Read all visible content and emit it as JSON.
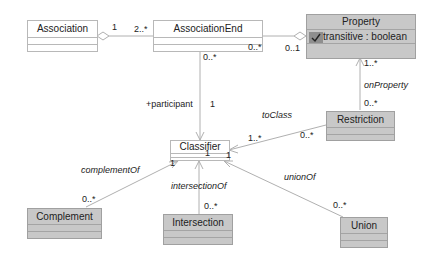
{
  "diagram": {
    "type": "UML class diagram",
    "classes": {
      "association": {
        "name": "Association",
        "style": "white"
      },
      "association_end": {
        "name": "AssociationEnd",
        "style": "white"
      },
      "property": {
        "name": "Property",
        "style": "grey",
        "attribute": "transitive : boolean",
        "attribute_icon": "attribute-icon"
      },
      "classifier": {
        "name": "Classifier",
        "style": "white"
      },
      "restriction": {
        "name": "Restriction",
        "style": "grey"
      },
      "complement": {
        "name": "Complement",
        "style": "grey"
      },
      "intersection": {
        "name": "Intersection",
        "style": "grey"
      },
      "union": {
        "name": "Union",
        "style": "grey"
      }
    },
    "relations": {
      "association_to_end": {
        "kind": "aggregation",
        "source_mult": "1",
        "target_mult": "2..*"
      },
      "end_to_property": {
        "kind": "aggregation",
        "source_mult": "0..*",
        "target_mult": "0..1"
      },
      "end_to_classifier": {
        "kind": "directed-association",
        "source_mult": "0..*",
        "role": "+participant",
        "target_mult": "1"
      },
      "restriction_to_property": {
        "kind": "directed-association",
        "name": "onProperty",
        "source_mult": "0..*",
        "target_mult": "1..*"
      },
      "restriction_to_classifier": {
        "kind": "directed-association",
        "name": "toClass",
        "source_mult": "0..*",
        "target_mult": "1..*"
      },
      "complement_to_classifier": {
        "kind": "directed-association",
        "name": "complementOf",
        "source_mult": "0..*",
        "target_mult": "1"
      },
      "intersection_to_classifier": {
        "kind": "directed-association",
        "name": "intersectionOf",
        "source_mult": "0..*",
        "target_mult": "1"
      },
      "union_to_classifier": {
        "kind": "directed-association",
        "name": "unionOf",
        "source_mult": "0..*",
        "target_mult": "1"
      }
    },
    "colors": {
      "line": "#b0b0b0",
      "grey_fill": "#c8c8c8",
      "white_fill": "#ffffff",
      "text": "#222222"
    }
  }
}
